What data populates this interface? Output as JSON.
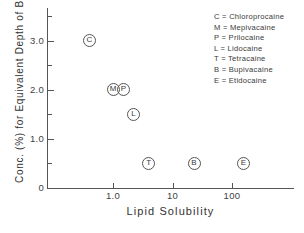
{
  "chart_data": {
    "type": "scatter",
    "title": "",
    "xlabel": "Lipid Solubility",
    "ylabel": "Conc. (%) for Equivalent Depth of Block",
    "xscale": "log",
    "yscale": "linear",
    "xlim": [
      0.2,
      300
    ],
    "ylim": [
      0,
      3.5
    ],
    "grid": false,
    "legend_position": "top-right",
    "x_ticks": [
      {
        "value": 1.0,
        "label": "1.0"
      },
      {
        "value": 10,
        "label": "10"
      },
      {
        "value": 100,
        "label": "100"
      }
    ],
    "y_ticks_major": [
      {
        "value": 0,
        "label": "0"
      },
      {
        "value": 1.0,
        "label": "1.0"
      },
      {
        "value": 2.0,
        "label": "2.0"
      },
      {
        "value": 3.0,
        "label": "3.0"
      }
    ],
    "y_ticks_minor": [
      0.5,
      1.5,
      2.5,
      3.5
    ],
    "points": [
      {
        "key": "C",
        "name": "Chloroprocaine",
        "x": 0.4,
        "y": 3.0
      },
      {
        "key": "M",
        "name": "Mepivacaine",
        "x": 1.0,
        "y": 2.0
      },
      {
        "key": "P",
        "name": "Prilocaine",
        "x": 1.5,
        "y": 2.0
      },
      {
        "key": "L",
        "name": "Lidocaine",
        "x": 2.2,
        "y": 1.5
      },
      {
        "key": "T",
        "name": "Tetracaine",
        "x": 4.0,
        "y": 0.5
      },
      {
        "key": "B",
        "name": "Bupivacaine",
        "x": 23.0,
        "y": 0.5
      },
      {
        "key": "E",
        "name": "Etidocaine",
        "x": 155.0,
        "y": 0.5
      }
    ]
  },
  "legend": {
    "separator": "=",
    "entries": [
      {
        "key": "C",
        "label": "Chloroprocaine"
      },
      {
        "key": "M",
        "label": "Mepivacaine"
      },
      {
        "key": "P",
        "label": "Prilocaine"
      },
      {
        "key": "L",
        "label": "Lidocaine"
      },
      {
        "key": "T",
        "label": "Tetracaine"
      },
      {
        "key": "B",
        "label": "Bupivacaine"
      },
      {
        "key": "E",
        "label": "Etidocaine"
      }
    ]
  },
  "colors": {
    "axis": "#555555",
    "text": "#3a3a3a",
    "background": "#ffffff",
    "marker": "#555555"
  }
}
